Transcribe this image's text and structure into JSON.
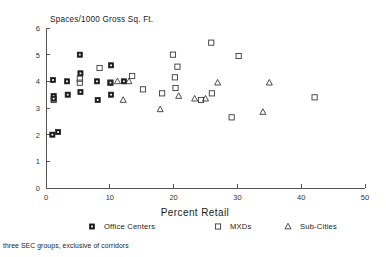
{
  "chart_data": {
    "type": "scatter",
    "title": "Spaces/1000 Gross Sq. Ft.",
    "xlabel": "Percent Retail",
    "ylabel": "Spaces/1000 Gross Sq. Ft.",
    "xlim": [
      0,
      50
    ],
    "ylim": [
      0,
      6
    ],
    "xticks": [
      0,
      10,
      20,
      30,
      40,
      50
    ],
    "yticks": [
      0,
      1,
      2,
      3,
      4,
      5,
      6
    ],
    "xtick_labels": [
      "0",
      "10",
      "20",
      "30",
      "40",
      "50"
    ],
    "ytick_labels": [
      "0",
      "1",
      "2",
      "3",
      "4",
      "5",
      "6"
    ],
    "grid": false,
    "legend_position": "below-axis",
    "footnote": "three SEC groups, exclusive of corridors",
    "series": [
      {
        "name": "Office Centers",
        "marker": "filled-square-with-dot",
        "points": [
          [
            1.0,
            2.0
          ],
          [
            1.9,
            2.1
          ],
          [
            1.1,
            4.05
          ],
          [
            1.2,
            3.45
          ],
          [
            1.2,
            3.35
          ],
          [
            3.3,
            4.0
          ],
          [
            3.4,
            3.5
          ],
          [
            5.3,
            5.0
          ],
          [
            5.4,
            4.3
          ],
          [
            5.4,
            3.6
          ],
          [
            8.0,
            4.0
          ],
          [
            8.1,
            3.3
          ],
          [
            10.2,
            4.6
          ],
          [
            10.1,
            3.95
          ],
          [
            10.2,
            3.5
          ],
          [
            12.2,
            4.0
          ]
        ]
      },
      {
        "name": "MXDs",
        "marker": "open-square",
        "points": [
          [
            1.2,
            3.3
          ],
          [
            5.3,
            4.1
          ],
          [
            5.3,
            3.95
          ],
          [
            8.4,
            4.5
          ],
          [
            10.1,
            3.95
          ],
          [
            13.5,
            4.2
          ],
          [
            15.2,
            3.7
          ],
          [
            18.2,
            3.55
          ],
          [
            19.9,
            5.0
          ],
          [
            20.6,
            4.55
          ],
          [
            20.2,
            4.15
          ],
          [
            20.3,
            3.75
          ],
          [
            24.3,
            3.3
          ],
          [
            25.9,
            5.45
          ],
          [
            26.0,
            3.55
          ],
          [
            29.1,
            2.65
          ],
          [
            30.2,
            4.95
          ],
          [
            42.1,
            3.4
          ]
        ]
      },
      {
        "name": "Sub-Cities",
        "marker": "open-triangle",
        "points": [
          [
            11.2,
            4.0
          ],
          [
            12.1,
            3.3
          ],
          [
            13.0,
            4.0
          ],
          [
            17.9,
            2.95
          ],
          [
            20.8,
            3.45
          ],
          [
            23.3,
            3.35
          ],
          [
            25.0,
            3.35
          ],
          [
            26.9,
            3.95
          ],
          [
            34.0,
            2.85
          ],
          [
            35.0,
            3.95
          ]
        ]
      }
    ]
  },
  "legend": {
    "entries": [
      {
        "label": "Office Centers",
        "marker": "filled-square-with-dot"
      },
      {
        "label": "MXDs",
        "marker": "open-square"
      },
      {
        "label": "Sub-Cities",
        "marker": "open-triangle"
      }
    ]
  }
}
